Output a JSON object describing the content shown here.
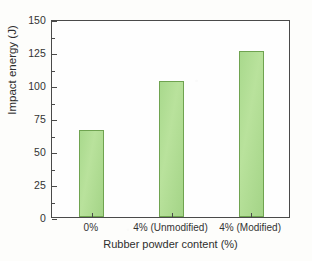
{
  "chart_data": {
    "type": "bar",
    "title": "",
    "categories": [
      "0%",
      "4% (Unmodified)",
      "4% (Modified)"
    ],
    "values": [
      66,
      103,
      126
    ],
    "xlabel": "Rubber powder content (%)",
    "ylabel": "Impact energy (J)",
    "ylim": [
      0,
      150
    ],
    "ytick_labels": [
      "0",
      "25",
      "50",
      "75",
      "100",
      "125",
      "150"
    ],
    "ytick_values": [
      0,
      25,
      50,
      75,
      100,
      125,
      150
    ],
    "yminor_values": [
      12.5,
      37.5,
      62.5,
      87.5,
      112.5,
      137.5
    ],
    "grid": false,
    "legend": false,
    "legend_position": "none",
    "bar_fill_color": "#a9d98d",
    "bar_edge_color": "#6fa350",
    "axis_color": "#4a4a4a",
    "background_color": "#fdfdfb"
  }
}
